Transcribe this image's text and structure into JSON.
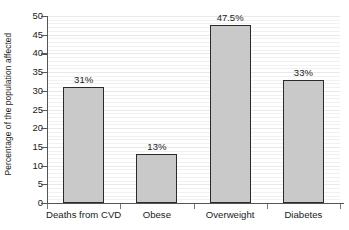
{
  "chart_data": {
    "type": "bar",
    "title": "",
    "xlabel": "",
    "ylabel": "Percentage of the population affected",
    "categories": [
      "Deaths from CVD",
      "Obese",
      "Overweight",
      "Diabetes"
    ],
    "values": [
      31,
      13,
      47.5,
      33
    ],
    "data_labels": [
      "31%",
      "13%",
      "47.5%",
      "33%"
    ],
    "ylim": [
      0,
      50
    ],
    "ytick_step": 5,
    "yticks": [
      0,
      5,
      10,
      15,
      20,
      25,
      30,
      35,
      40,
      45,
      50
    ],
    "ytick_labels": [
      "0",
      "5",
      "10",
      "15",
      "20",
      "25",
      "30",
      "35",
      "40",
      "45",
      "50"
    ],
    "grid": "horizontal",
    "legend": "none",
    "bar_fill_color": "#c9c9c9",
    "bar_edge_color": "#2b2b2b",
    "axis_color": "#555555",
    "gridline_color": "#e9e9e9",
    "background_color": "#ffffff"
  }
}
